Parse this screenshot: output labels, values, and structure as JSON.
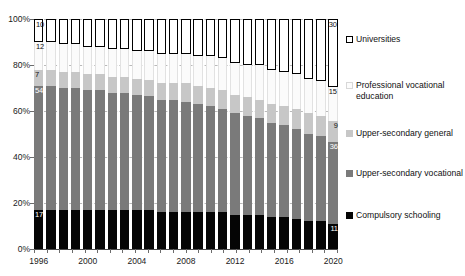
{
  "chart_data": {
    "type": "bar",
    "subtype": "stacked-100-percent",
    "title": "",
    "xlabel": "",
    "ylabel": "",
    "ylim": [
      0,
      100
    ],
    "y_ticks": [
      "0%",
      "20%",
      "40%",
      "60%",
      "80%",
      "100%"
    ],
    "y_tick_values": [
      0,
      20,
      40,
      60,
      80,
      100
    ],
    "grid": true,
    "legend_position": "right",
    "categories": [
      "1996",
      "1997",
      "1998",
      "1999",
      "2000",
      "2001",
      "2002",
      "2003",
      "2004",
      "2005",
      "2006",
      "2007",
      "2008",
      "2009",
      "2010",
      "2011",
      "2012",
      "2013",
      "2014",
      "2015",
      "2016",
      "2017",
      "2018",
      "2019",
      "2020"
    ],
    "x_tick_labels": [
      "1996",
      "2000",
      "2004",
      "2008",
      "2012",
      "2016",
      "2020"
    ],
    "x_tick_label_indices": [
      0,
      4,
      8,
      12,
      16,
      20,
      24
    ],
    "series": [
      {
        "name": "Compulsory schooling",
        "key": "compulsory",
        "color": "#050505",
        "label_color": "light",
        "values": [
          17,
          17,
          17,
          17,
          17,
          17,
          17,
          17,
          17,
          17,
          16,
          16,
          16,
          16,
          16,
          16,
          15,
          15,
          15,
          14,
          14,
          13,
          12,
          12,
          11
        ],
        "first_label": "17",
        "last_label": "11"
      },
      {
        "name": "Upper-secondary vocational",
        "key": "uppervoc",
        "color": "#7a7a7a",
        "label_color": "light",
        "values": [
          54,
          54,
          53,
          53,
          52,
          52,
          51,
          51,
          50,
          50,
          49,
          49,
          48,
          47,
          46,
          45,
          44,
          43,
          42,
          41,
          40,
          39,
          38,
          37,
          36
        ],
        "first_label": "54",
        "last_label": "36"
      },
      {
        "name": "Upper-secondary general",
        "key": "uppergen",
        "color": "#c7c7c7",
        "label_color": "dark",
        "values": [
          7,
          7,
          7,
          7,
          7,
          7,
          7,
          7,
          7,
          7,
          7,
          7,
          8,
          8,
          8,
          8,
          8,
          8,
          8,
          8,
          8,
          9,
          9,
          9,
          9
        ],
        "first_label": "7",
        "last_label": "9"
      },
      {
        "name": "Professional vocational education",
        "key": "profvoc",
        "color": "#fbfbfb",
        "label_color": "dark",
        "values": [
          12,
          12,
          12,
          12,
          12,
          12,
          12,
          12,
          12,
          13,
          13,
          13,
          13,
          13,
          14,
          14,
          14,
          14,
          15,
          15,
          15,
          15,
          15,
          15,
          15
        ],
        "first_label": "12",
        "last_label": "15"
      },
      {
        "name": "Universities",
        "key": "universities",
        "color": "#ffffff",
        "label_color": "dark",
        "values": [
          10,
          10,
          11,
          11,
          12,
          12,
          13,
          13,
          14,
          14,
          15,
          15,
          15,
          16,
          16,
          17,
          19,
          20,
          20,
          22,
          23,
          24,
          26,
          27,
          30
        ],
        "first_label": "10",
        "last_label": "30"
      }
    ],
    "legend_entries": [
      {
        "label": "Universities",
        "key": "universities"
      },
      {
        "label": "Professional vocational education",
        "key": "profvoc"
      },
      {
        "label": "Upper-secondary general",
        "key": "uppergen"
      },
      {
        "label": "Upper-secondary vocational",
        "key": "uppervoc"
      },
      {
        "label": "Compulsory schooling",
        "key": "compulsory"
      }
    ]
  }
}
